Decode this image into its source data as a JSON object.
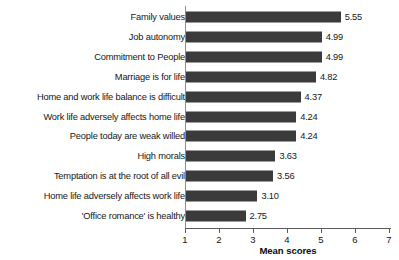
{
  "chart_data": {
    "type": "bar",
    "orientation": "horizontal",
    "title": "",
    "xlabel": "Mean scores",
    "ylabel": "",
    "xlim": [
      1,
      7
    ],
    "xticks": [
      1,
      2,
      3,
      4,
      5,
      6,
      7
    ],
    "grid": false,
    "legend": null,
    "bar_color": "#3b3b3b",
    "categories": [
      "Family values",
      "Job autonomy",
      "Commitment to People",
      "Marriage is for life",
      "Home and work life balance is difficult",
      "Work life adversely affects home life",
      "People today are weak willed",
      "High morals",
      "Temptation is at the root of all evil",
      "Home life adversely affects work life",
      "'Office romance' is healthy"
    ],
    "values": [
      5.55,
      4.99,
      4.99,
      4.82,
      4.37,
      4.24,
      4.24,
      3.63,
      3.56,
      3.1,
      2.75
    ],
    "value_labels": [
      "5.55",
      "4.99",
      "4.99",
      "4.82",
      "4.37",
      "4.24",
      "4.24",
      "3.63",
      "3.56",
      "3.10",
      "2.75"
    ],
    "xtick_labels": [
      "1",
      "2",
      "3",
      "4",
      "5",
      "6",
      "7"
    ]
  }
}
